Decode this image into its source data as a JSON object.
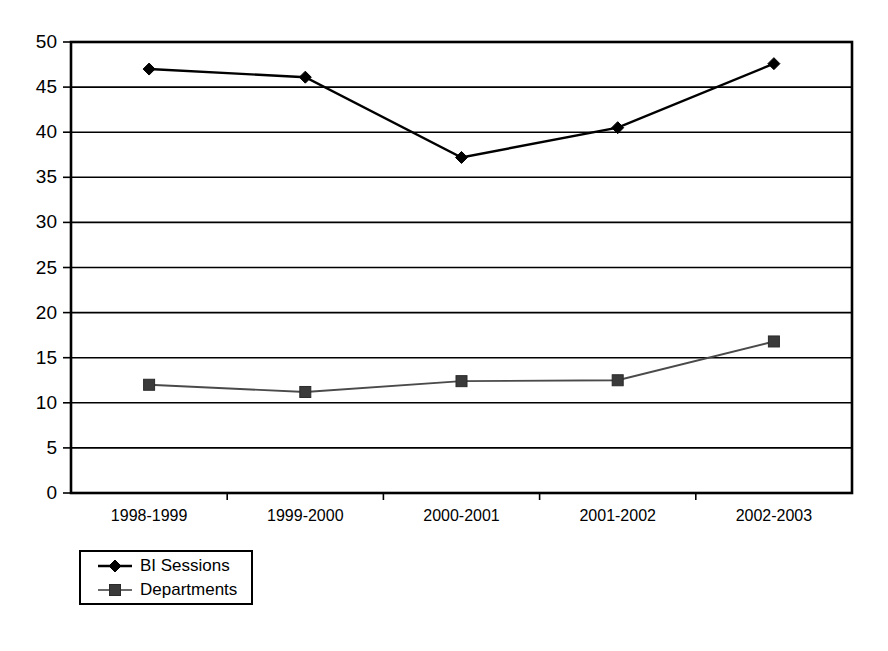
{
  "chart_data": {
    "type": "line",
    "title": "",
    "xlabel": "",
    "ylabel": "",
    "categories": [
      "1998-1999",
      "1999-2000",
      "2000-2001",
      "2001-2002",
      "2002-2003"
    ],
    "series": [
      {
        "name": "BI Sessions",
        "marker": "diamond",
        "color": "#000000",
        "values": [
          47.0,
          46.1,
          37.2,
          40.5,
          47.6
        ]
      },
      {
        "name": "Departments",
        "marker": "square",
        "color": "#3a3a3a",
        "values": [
          12.0,
          11.2,
          12.4,
          12.5,
          16.8
        ]
      }
    ],
    "ylim": [
      0,
      50
    ],
    "yticks": [
      0,
      5,
      10,
      15,
      20,
      25,
      30,
      35,
      40,
      45,
      50
    ],
    "ytick_labels": [
      "0",
      "5",
      "10",
      "15",
      "20",
      "25",
      "30",
      "35",
      "40",
      "45",
      "50"
    ],
    "grid": true,
    "grid_axis": "y",
    "legend_position": "below-left",
    "legend_entries": [
      "BI Sessions",
      "Departments"
    ]
  }
}
